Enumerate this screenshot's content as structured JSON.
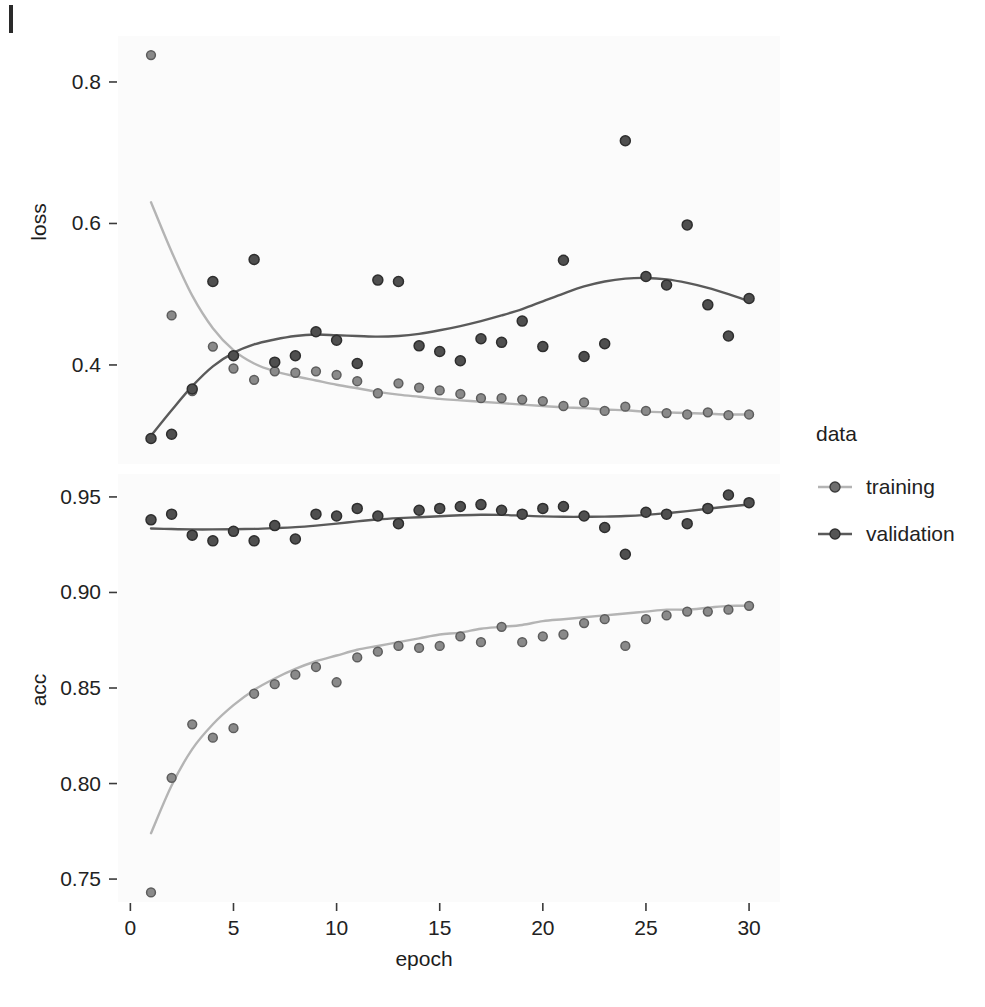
{
  "figure": {
    "kind": "faceted-scatter-with-smooth",
    "background_color": "#ffffff",
    "panel_background_color": "#fbfbfb"
  },
  "legend": {
    "title": "data",
    "position": "right",
    "entries": [
      {
        "label": "training",
        "color": "#b4b4b4",
        "point_color": "#4d4d4d"
      },
      {
        "label": "validation",
        "color": "#5a5a5a",
        "point_color": "#4d4d4d"
      }
    ]
  },
  "axes": {
    "x_label": "epoch",
    "x_ticks": [
      "0",
      "5",
      "10",
      "15",
      "20",
      "25",
      "30"
    ],
    "x_tick_values": [
      0,
      5,
      10,
      15,
      20,
      25,
      30
    ],
    "x_range": [
      -0.6,
      31.5
    ],
    "panels": [
      {
        "name": "loss",
        "y_label": "loss",
        "y_ticks": [
          "0.4",
          "0.6",
          "0.8"
        ],
        "y_tick_values": [
          0.4,
          0.6,
          0.8
        ],
        "y_range": [
          0.26,
          0.865
        ]
      },
      {
        "name": "acc",
        "y_label": "acc",
        "y_ticks": [
          "0.75",
          "0.80",
          "0.85",
          "0.90",
          "0.95"
        ],
        "y_tick_values": [
          0.75,
          0.8,
          0.85,
          0.9,
          0.95
        ],
        "y_range": [
          0.738,
          0.962
        ]
      }
    ]
  },
  "chart_data": [
    {
      "type": "scatter",
      "title": "",
      "panel": "loss",
      "xlabel": "epoch",
      "ylabel": "loss",
      "xlim": [
        -0.6,
        31.5
      ],
      "ylim": [
        0.26,
        0.865
      ],
      "grid": false,
      "legend_position": "right",
      "x": [
        1,
        2,
        3,
        4,
        5,
        6,
        7,
        8,
        9,
        10,
        11,
        12,
        13,
        14,
        15,
        16,
        17,
        18,
        19,
        20,
        21,
        22,
        23,
        24,
        25,
        26,
        27,
        28,
        29,
        30
      ],
      "series": [
        {
          "name": "training",
          "color": "#b4b4b4",
          "values": [
            0.838,
            0.47,
            0.363,
            0.426,
            0.395,
            0.379,
            0.391,
            0.389,
            0.391,
            0.386,
            0.377,
            0.36,
            0.374,
            0.368,
            0.364,
            0.359,
            0.353,
            0.353,
            0.351,
            0.349,
            0.342,
            0.347,
            0.335,
            0.341,
            0.335,
            0.332,
            0.33,
            0.333,
            0.329,
            0.33
          ],
          "smooth": [
            0.63,
            0.56,
            0.498,
            0.452,
            0.421,
            0.402,
            0.391,
            0.384,
            0.378,
            0.372,
            0.367,
            0.362,
            0.358,
            0.355,
            0.352,
            0.35,
            0.348,
            0.346,
            0.344,
            0.342,
            0.34,
            0.339,
            0.337,
            0.336,
            0.334,
            0.333,
            0.332,
            0.331,
            0.33,
            0.33
          ]
        },
        {
          "name": "validation",
          "color": "#5a5a5a",
          "values": [
            0.296,
            0.302,
            0.366,
            0.518,
            0.413,
            0.549,
            0.404,
            0.413,
            0.447,
            0.435,
            0.402,
            0.52,
            0.518,
            0.427,
            0.419,
            0.406,
            0.437,
            0.432,
            0.462,
            0.426,
            0.548,
            0.412,
            0.43,
            0.717,
            0.525,
            0.513,
            0.598,
            0.485,
            0.441,
            0.494
          ]
        }
      ],
      "validation_smooth": [
        0.3,
        0.336,
        0.37,
        0.398,
        0.417,
        0.429,
        0.436,
        0.441,
        0.443,
        0.442,
        0.441,
        0.44,
        0.441,
        0.444,
        0.449,
        0.455,
        0.462,
        0.47,
        0.479,
        0.49,
        0.501,
        0.511,
        0.518,
        0.522,
        0.523,
        0.521,
        0.516,
        0.509,
        0.5,
        0.49
      ]
    },
    {
      "type": "scatter",
      "title": "",
      "panel": "acc",
      "xlabel": "epoch",
      "ylabel": "acc",
      "xlim": [
        -0.6,
        31.5
      ],
      "ylim": [
        0.738,
        0.962
      ],
      "grid": false,
      "legend_position": "right",
      "x": [
        1,
        2,
        3,
        4,
        5,
        6,
        7,
        8,
        9,
        10,
        11,
        12,
        13,
        14,
        15,
        16,
        17,
        18,
        19,
        20,
        21,
        22,
        23,
        24,
        25,
        26,
        27,
        28,
        29,
        30
      ],
      "series": [
        {
          "name": "training",
          "color": "#b4b4b4",
          "values": [
            0.743,
            0.803,
            0.831,
            0.824,
            0.829,
            0.847,
            0.852,
            0.857,
            0.861,
            0.853,
            0.866,
            0.869,
            0.872,
            0.871,
            0.872,
            0.877,
            0.874,
            0.882,
            0.874,
            0.877,
            0.878,
            0.884,
            0.886,
            0.872,
            0.886,
            0.888,
            0.89,
            0.89,
            0.891,
            0.893
          ],
          "smooth": [
            0.774,
            0.799,
            0.818,
            0.831,
            0.841,
            0.849,
            0.855,
            0.86,
            0.864,
            0.867,
            0.87,
            0.872,
            0.874,
            0.876,
            0.878,
            0.879,
            0.881,
            0.882,
            0.883,
            0.885,
            0.886,
            0.887,
            0.888,
            0.889,
            0.89,
            0.891,
            0.891,
            0.892,
            0.893,
            0.893
          ]
        },
        {
          "name": "validation",
          "color": "#5a5a5a",
          "values": [
            0.938,
            0.941,
            0.93,
            0.927,
            0.932,
            0.927,
            0.935,
            0.928,
            0.941,
            0.94,
            0.944,
            0.94,
            0.936,
            0.943,
            0.944,
            0.945,
            0.946,
            0.943,
            0.941,
            0.944,
            0.945,
            0.94,
            0.934,
            0.92,
            0.942,
            0.941,
            0.936,
            0.944,
            0.951,
            0.947
          ]
        }
      ],
      "validation_smooth": [
        0.9335,
        0.9332,
        0.933,
        0.933,
        0.9331,
        0.9333,
        0.9337,
        0.9342,
        0.935,
        0.936,
        0.9372,
        0.9382,
        0.9389,
        0.9394,
        0.9399,
        0.9404,
        0.9407,
        0.9406,
        0.9402,
        0.9398,
        0.9396,
        0.9396,
        0.9397,
        0.94,
        0.9406,
        0.9415,
        0.9426,
        0.9438,
        0.945,
        0.946
      ]
    }
  ]
}
